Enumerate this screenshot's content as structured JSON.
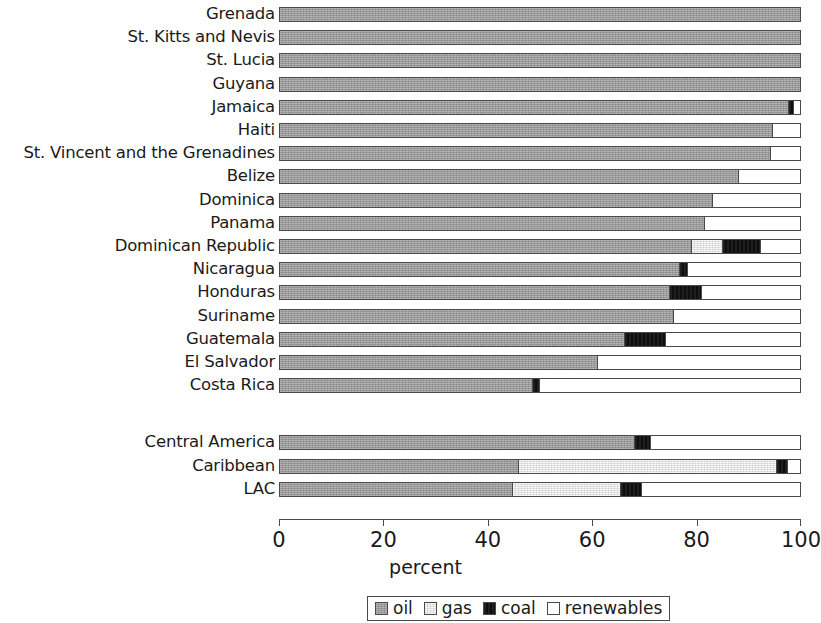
{
  "chart_data": {
    "type": "bar",
    "orientation": "horizontal",
    "stacked": true,
    "title": "",
    "xlabel": "percent",
    "ylabel": "",
    "xlim": [
      0,
      100
    ],
    "xticks": [
      0,
      20,
      40,
      60,
      80,
      100
    ],
    "grid": false,
    "legend_position": "bottom",
    "series_names": [
      "oil",
      "gas",
      "coal",
      "renewables"
    ],
    "series_colors": {
      "oil": "#9a9a9a",
      "gas": "#e2e2e2",
      "coal": "#111111",
      "renewables": "#ffffff"
    },
    "categories": [
      "Grenada",
      "St. Kitts and Nevis",
      "St. Lucia",
      "Guyana",
      "Jamaica",
      "Haiti",
      "St. Vincent and the Grenadines",
      "Belize",
      "Dominica",
      "Panama",
      "Dominican Republic",
      "Nicaragua",
      "Honduras",
      "Suriname",
      "Guatemala",
      "El Salvador",
      "Costa Rica",
      "Central America",
      "Caribbean",
      "LAC"
    ],
    "series": [
      {
        "name": "oil",
        "values": [
          100,
          100,
          100,
          100,
          97.5,
          94.5,
          94,
          88,
          83,
          81.5,
          79,
          76.7,
          74.8,
          75.5,
          66,
          61,
          48.5,
          68,
          45.7,
          44.6
        ]
      },
      {
        "name": "gas",
        "values": [
          0,
          0,
          0,
          0,
          0,
          0,
          0,
          0,
          0,
          0,
          5.8,
          0,
          0,
          0,
          0,
          0,
          0,
          0,
          49.6,
          20.7
        ]
      },
      {
        "name": "coal",
        "values": [
          0,
          0,
          0,
          0,
          1,
          0,
          0,
          0,
          0,
          0,
          7.4,
          1.5,
          6,
          0,
          8,
          0,
          1.4,
          3.1,
          2.1,
          4
        ]
      },
      {
        "name": "renewables",
        "values": [
          0,
          0,
          0,
          0,
          1.5,
          5.5,
          6,
          12,
          17,
          18.5,
          7.8,
          21.8,
          19.2,
          24.5,
          26,
          39,
          50.1,
          28.9,
          2.6,
          30.7
        ]
      }
    ]
  },
  "axis": {
    "tick_labels": [
      "0",
      "20",
      "40",
      "60",
      "80",
      "100"
    ],
    "title": "percent"
  },
  "legend": {
    "items": [
      {
        "label": "oil",
        "swatch": "oil-swatch"
      },
      {
        "label": "gas",
        "swatch": "gas-swatch"
      },
      {
        "label": "coal",
        "swatch": "coal-swatch"
      },
      {
        "label": "renewables",
        "swatch": "renewables-swatch"
      }
    ]
  }
}
